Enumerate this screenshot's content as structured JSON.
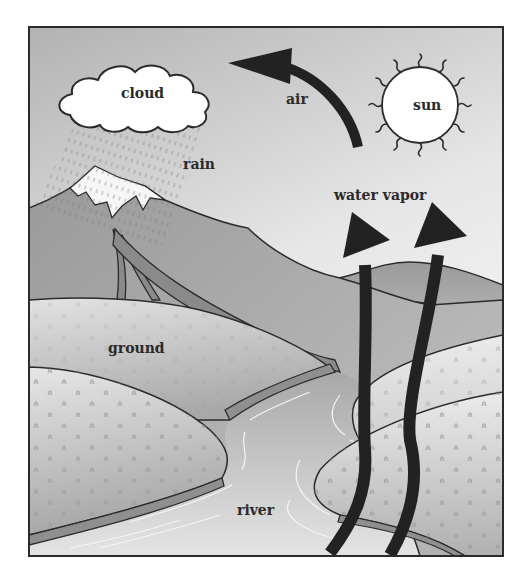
{
  "diagram": {
    "type": "water-cycle",
    "labels": {
      "cloud": "cloud",
      "air": "air",
      "sun": "sun",
      "rain": "rain",
      "water_vapor": "water vapor",
      "ground": "ground",
      "river": "river"
    },
    "flows": [
      {
        "from": "river",
        "to": "water vapor",
        "via": "evaporation arrows (2)"
      },
      {
        "from": "water vapor",
        "to": "cloud",
        "via": "air arrow"
      },
      {
        "from": "cloud",
        "to": "mountain",
        "via": "rain"
      },
      {
        "from": "mountain",
        "to": "river",
        "via": "streams"
      }
    ],
    "colors": {
      "arrow": "#222222",
      "outline": "#2b2b2b",
      "sky_top": "#b9b9b9",
      "sky_bottom": "#f4f4f4",
      "mountain": "#a9a9a9",
      "stream": "#8a8a8a",
      "ground": "#c8c8c8",
      "river": "#bdbdbd"
    }
  }
}
